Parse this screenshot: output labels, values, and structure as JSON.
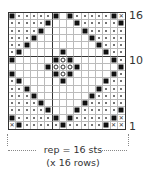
{
  "chart": {
    "columns": 16,
    "rows": 16,
    "vertical_divider_after_col": 6,
    "horizontal_divider_after_top_rows": 6,
    "legend_symbols": {
      "S": "filled-square",
      ".": "dot",
      "O": "open-circle",
      "X": "cross",
      "_": "blank"
    },
    "grid_top_to_bottom": [
      "S.....S_S.....SX",
      ".....S___S.....S",
      "....S_____S.....",
      "...S_______S....",
      "..S_________S...",
      ".S_____S_____S..",
      "S_____SOS_____S.",
      "_____SOOOS_____S",
      "S_____SOS_____S.",
      ".S_____S_____S..",
      "..S_________S...",
      "...S_______S....",
      "....S_____S.....",
      ".....S___S.....S",
      "S.....S_S.....SX",
      "XS.....S.....SXX"
    ]
  },
  "row_labels": [
    {
      "text": "16",
      "row": 16
    },
    {
      "text": "10",
      "row": 10
    },
    {
      "text": "1",
      "row": 1
    }
  ],
  "repeat": {
    "line1": "rep = 16 sts",
    "line2": "(x 16 rows)"
  }
}
